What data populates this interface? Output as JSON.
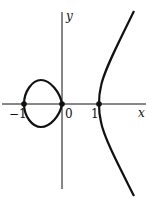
{
  "figure": {
    "title": "",
    "axes": {
      "x_label": "x",
      "y_label": "y",
      "ticks": [
        {
          "value": -1,
          "label": "−1"
        },
        {
          "value": 0,
          "label": "0"
        },
        {
          "value": 1,
          "label": "1"
        }
      ]
    },
    "curve": {
      "description": "Elliptic curve with closed oval between x=-1 and x=0 and an unbounded branch starting at x=1",
      "equation_hint": "y^2 = x^3 - x",
      "marked_points": [
        {
          "x": -1,
          "y": 0
        },
        {
          "x": 0,
          "y": 0
        },
        {
          "x": 1,
          "y": 0
        }
      ]
    },
    "colors": {
      "curve": "#111111",
      "axes": "#111111",
      "background": "#ffffff"
    }
  }
}
